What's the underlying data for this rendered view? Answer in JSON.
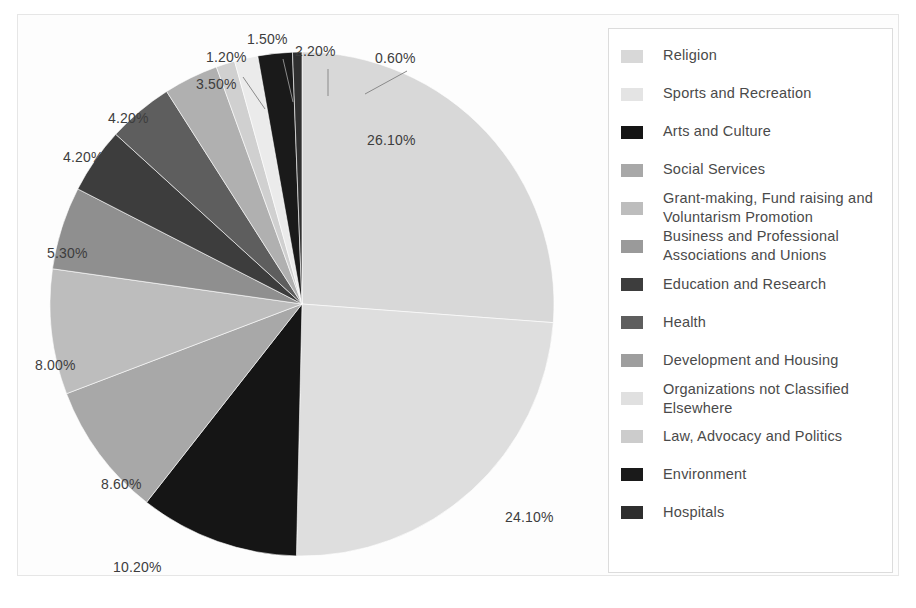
{
  "chart_data": {
    "type": "pie",
    "title": "",
    "subtitle": "",
    "xlabel": "",
    "ylabel": "",
    "legend_position": "right",
    "grid": false,
    "start_angle_deg": 0,
    "direction": "clockwise",
    "units": "percent",
    "categories": [
      "Religion",
      "Sports and Recreation",
      "Arts and Culture",
      "Social Services",
      "Grant-making, Fund raising and Voluntarism Promotion",
      "Business and Professional Associations and Unions",
      "Education and Research",
      "Health",
      "Development and Housing",
      "Organizations not Classified Elsewhere",
      "Law, Advocacy and Politics",
      "Environment",
      "Hospitals"
    ],
    "values": [
      26.1,
      24.1,
      10.2,
      8.6,
      8.0,
      5.3,
      4.2,
      4.2,
      3.5,
      1.5,
      1.2,
      2.2,
      0.6
    ],
    "value_labels": [
      "26.10%",
      "24.10%",
      "10.20%",
      "8.60%",
      "8.00%",
      "5.30%",
      "4.20%",
      "4.20%",
      "3.50%",
      "1.50%",
      "1.20%",
      "2.20%",
      "0.60%"
    ],
    "colors": [
      "#d8d8d8",
      "#dedede",
      "#151515",
      "#a8a8a8",
      "#bdbdbd",
      "#8f8f8f",
      "#3d3d3d",
      "#5e5e5e",
      "#b0b0b0",
      "#ebebeb",
      "#d0d0d0",
      "#1a1a1a",
      "#303030"
    ]
  },
  "legend": {
    "items": [
      {
        "label": "Religion",
        "swatch": "#d8d8d8"
      },
      {
        "label": "Sports and Recreation",
        "swatch": "#e4e4e4"
      },
      {
        "label": "Arts and Culture",
        "swatch": "#151515"
      },
      {
        "label": "Social Services",
        "swatch": "#a8a8a8"
      },
      {
        "label": "Grant-making, Fund raising and Voluntarism Promotion",
        "swatch": "#bdbdbd"
      },
      {
        "label": "Business and Professional Associations and Unions",
        "swatch": "#9a9a9a"
      },
      {
        "label": "Education and Research",
        "swatch": "#3d3d3d"
      },
      {
        "label": "Health",
        "swatch": "#5e5e5e"
      },
      {
        "label": "Development and Housing",
        "swatch": "#9e9e9e"
      },
      {
        "label": "Organizations not Classified Elsewhere",
        "swatch": "#e0e0e0"
      },
      {
        "label": "Law, Advocacy and Politics",
        "swatch": "#cccccc"
      },
      {
        "label": "Environment",
        "swatch": "#1a1a1a"
      },
      {
        "label": "Hospitals",
        "swatch": "#2e2e2e"
      }
    ]
  },
  "pie_labels": [
    {
      "text": "26.10%",
      "left": 350,
      "top": 118
    },
    {
      "text": "24.10%",
      "left": 488,
      "top": 495
    },
    {
      "text": "10.20%",
      "left": 96,
      "top": 545
    },
    {
      "text": "8.60%",
      "left": 84,
      "top": 462
    },
    {
      "text": "8.00%",
      "left": 18,
      "top": 343
    },
    {
      "text": "5.30%",
      "left": 30,
      "top": 231
    },
    {
      "text": "4.20%",
      "left": 46,
      "top": 135
    },
    {
      "text": "4.20%",
      "left": 91,
      "top": 96
    },
    {
      "text": "3.50%",
      "left": 179,
      "top": 62
    },
    {
      "text": "1.20%",
      "left": 189,
      "top": 35
    },
    {
      "text": "1.50%",
      "left": 230,
      "top": 17
    },
    {
      "text": "2.20%",
      "left": 278,
      "top": 29
    },
    {
      "text": "0.60%",
      "left": 358,
      "top": 36
    }
  ]
}
